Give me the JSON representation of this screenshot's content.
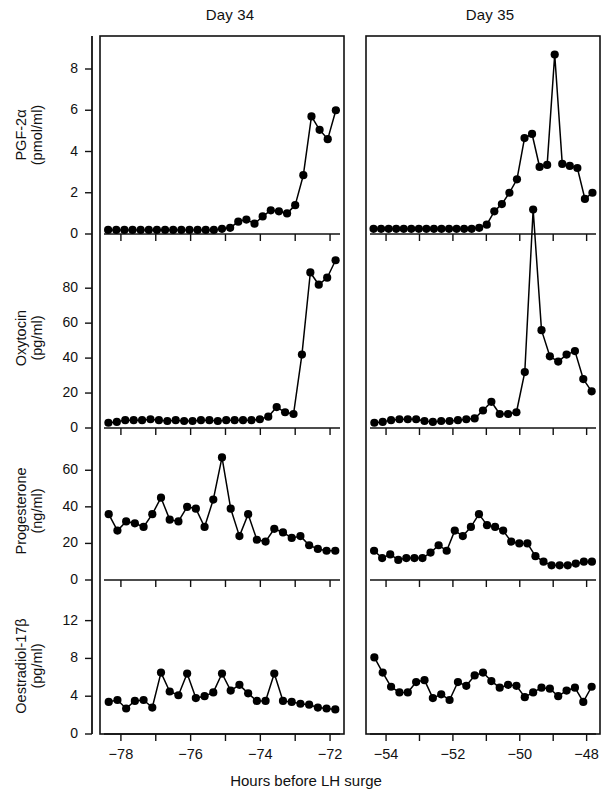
{
  "figure": {
    "xaxis_title": "Hours before LH surge",
    "panel_titles": [
      "Day 34",
      "Day 35"
    ]
  },
  "chart_data": {
    "type": "line",
    "xlabel": "Hours before LH surge",
    "grid": false,
    "legend": "none",
    "columns": [
      {
        "name": "Day 34",
        "xlim": [
          -78.6,
          -71.6
        ],
        "xticks": [
          -78,
          -77,
          -76,
          -75,
          -74,
          -73,
          -72
        ],
        "xticklabels": [
          "−78",
          "",
          "−76",
          "",
          "−74",
          "",
          "−72"
        ]
      },
      {
        "name": "Day 35",
        "xlim": [
          -54.6,
          -47.6
        ],
        "xticks": [
          -54,
          -53,
          -52,
          -51,
          -50,
          -49,
          -48
        ],
        "xticklabels": [
          "−54",
          "",
          "−52",
          "",
          "−50",
          "",
          "−48"
        ]
      }
    ],
    "rows": [
      {
        "id": "pgf2a",
        "ylabel_line1": "PGF-2α",
        "ylabel_line2": "(pmol/ml)",
        "units": "pmol/ml",
        "ylim": [
          0,
          9.6
        ],
        "yticks": [
          0,
          2,
          4,
          6,
          8
        ],
        "yticklabels": [
          "0",
          "2",
          "4",
          "6",
          "8"
        ],
        "series": [
          {
            "name": "Day 34",
            "column": 0,
            "x": [
              -78.45,
              -78.2,
              -77.95,
              -77.7,
              -77.45,
              -77.2,
              -76.95,
              -76.7,
              -76.45,
              -76.2,
              -75.95,
              -75.7,
              -75.45,
              -75.2,
              -74.95,
              -74.7,
              -74.45,
              -74.2,
              -73.95,
              -73.7,
              -73.45,
              -73.2,
              -72.95,
              -72.7,
              -72.45,
              -72.2,
              -71.95,
              -71.7
            ],
            "values": [
              0.2,
              0.2,
              0.2,
              0.2,
              0.2,
              0.2,
              0.2,
              0.2,
              0.2,
              0.2,
              0.2,
              0.2,
              0.2,
              0.2,
              0.25,
              0.3,
              0.6,
              0.7,
              0.5,
              0.85,
              1.15,
              1.1,
              1.0,
              1.4,
              2.85,
              5.7,
              5.05,
              4.6,
              6.0
            ]
          },
          {
            "name": "Day 35",
            "column": 1,
            "x": [
              -54.45,
              -54.2,
              -53.95,
              -53.7,
              -53.45,
              -53.2,
              -52.95,
              -52.7,
              -52.45,
              -52.2,
              -51.95,
              -51.7,
              -51.45,
              -51.2,
              -50.95,
              -50.7,
              -50.45,
              -50.2,
              -49.95,
              -49.7,
              -49.45,
              -49.2,
              -48.95,
              -48.7,
              -48.45,
              -48.2,
              -47.95,
              -47.7
            ],
            "values": [
              0.25,
              0.25,
              0.25,
              0.25,
              0.25,
              0.25,
              0.25,
              0.25,
              0.25,
              0.25,
              0.25,
              0.25,
              0.25,
              0.25,
              0.3,
              0.45,
              1.1,
              1.45,
              2.0,
              2.65,
              4.65,
              4.85,
              3.25,
              3.35,
              8.7,
              3.4,
              3.3,
              3.2,
              1.7,
              2.0
            ]
          }
        ]
      },
      {
        "id": "oxytocin",
        "ylabel_line1": "Oxytocin",
        "ylabel_line2": "(pg/ml)",
        "units": "pg/ml",
        "ylim": [
          0,
          103
        ],
        "yticks": [
          0,
          20,
          40,
          60,
          80
        ],
        "yticklabels": [
          "0",
          "20",
          "40",
          "60",
          "80"
        ],
        "series": [
          {
            "name": "Day 34",
            "column": 0,
            "x": [
              -78.45,
              -78.2,
              -77.95,
              -77.7,
              -77.45,
              -77.2,
              -76.95,
              -76.7,
              -76.45,
              -76.2,
              -75.95,
              -75.7,
              -75.45,
              -75.2,
              -74.95,
              -74.7,
              -74.45,
              -74.2,
              -73.95,
              -73.7,
              -73.45,
              -73.2,
              -72.95,
              -72.7,
              -72.45,
              -72.2,
              -71.95,
              -71.7
            ],
            "values": [
              3.0,
              3.5,
              4.5,
              4.5,
              4.5,
              5.0,
              4.5,
              4.0,
              4.5,
              4.0,
              4.0,
              4.5,
              4.5,
              4.0,
              4.5,
              4.5,
              4.5,
              4.5,
              5.0,
              6.5,
              12.0,
              9.0,
              8.0,
              42.0,
              89.0,
              82.0,
              86.0,
              96.0
            ]
          },
          {
            "name": "Day 35",
            "column": 1,
            "x": [
              -54.45,
              -54.2,
              -53.95,
              -53.7,
              -53.45,
              -53.2,
              -52.95,
              -52.7,
              -52.45,
              -52.2,
              -51.95,
              -51.7,
              -51.45,
              -51.2,
              -50.95,
              -50.7,
              -50.45,
              -50.2,
              -49.95,
              -49.7,
              -49.45,
              -49.2,
              -48.95,
              -48.7,
              -48.45,
              -48.2,
              -47.95,
              -47.7
            ],
            "values": [
              3.0,
              3.5,
              4.5,
              5.0,
              5.0,
              5.0,
              4.0,
              3.5,
              4.0,
              4.0,
              4.5,
              5.0,
              5.5,
              10.0,
              15.0,
              8.0,
              8.0,
              9.0,
              32.0,
              125.0,
              56.0,
              41.0,
              38.0,
              42.0,
              44.0,
              28.0,
              21.0
            ]
          }
        ]
      },
      {
        "id": "progesterone",
        "ylabel_line1": "Progesterone",
        "ylabel_line2": "(ng/ml)",
        "units": "ng/ml",
        "ylim": [
          0,
          76
        ],
        "yticks": [
          0,
          20,
          40,
          60
        ],
        "yticklabels": [
          "0",
          "20",
          "40",
          "60"
        ],
        "series": [
          {
            "name": "Day 34",
            "column": 0,
            "x": [
              -78.45,
              -78.2,
              -77.95,
              -77.7,
              -77.45,
              -77.2,
              -76.95,
              -76.7,
              -76.45,
              -76.2,
              -75.95,
              -75.7,
              -75.45,
              -75.2,
              -74.95,
              -74.7,
              -74.45,
              -74.2,
              -73.95,
              -73.7,
              -73.45,
              -73.2,
              -72.95,
              -72.7,
              -72.45,
              -72.2,
              -71.95,
              -71.7
            ],
            "values": [
              36.0,
              27.0,
              32.0,
              31.0,
              29.0,
              36.0,
              45.0,
              33.0,
              32.0,
              40.0,
              39.0,
              29.0,
              44.0,
              67.0,
              39.0,
              24.0,
              36.0,
              22.0,
              21.0,
              28.0,
              26.0,
              23.0,
              24.0,
              19.0,
              17.0,
              16.0,
              16.0
            ]
          },
          {
            "name": "Day 35",
            "column": 1,
            "x": [
              -54.45,
              -54.2,
              -53.95,
              -53.7,
              -53.45,
              -53.2,
              -52.95,
              -52.7,
              -52.45,
              -52.2,
              -51.95,
              -51.7,
              -51.45,
              -51.2,
              -50.95,
              -50.7,
              -50.45,
              -50.2,
              -49.95,
              -49.7,
              -49.45,
              -49.2,
              -48.95,
              -48.7,
              -48.45,
              -48.2,
              -47.95,
              -47.7
            ],
            "values": [
              16.0,
              12.0,
              14.0,
              11.0,
              12.0,
              12.0,
              12.0,
              15.0,
              19.0,
              16.0,
              27.0,
              24.0,
              29.0,
              36.0,
              30.0,
              29.0,
              27.0,
              21.0,
              20.0,
              20.0,
              13.0,
              10.0,
              8.0,
              8.0,
              8.0,
              9.0,
              10.0,
              10.0
            ]
          }
        ]
      },
      {
        "id": "oestradiol",
        "ylabel_line1": "Oestradiol-17β",
        "ylabel_line2": "(pg/ml)",
        "units": "pg/ml",
        "ylim": [
          0,
          14.5
        ],
        "yticks": [
          0,
          4,
          8,
          12
        ],
        "yticklabels": [
          "0",
          "4",
          "8",
          "12"
        ],
        "series": [
          {
            "name": "Day 34",
            "column": 0,
            "x": [
              -78.45,
              -78.2,
              -77.95,
              -77.7,
              -77.45,
              -77.2,
              -76.95,
              -76.7,
              -76.45,
              -76.2,
              -75.95,
              -75.7,
              -75.45,
              -75.2,
              -74.95,
              -74.7,
              -74.45,
              -74.2,
              -73.95,
              -73.7,
              -73.45,
              -73.2,
              -72.95,
              -72.7,
              -72.45,
              -72.2,
              -71.95,
              -71.7
            ],
            "values": [
              3.4,
              3.6,
              2.7,
              3.5,
              3.6,
              2.8,
              6.5,
              4.5,
              4.1,
              6.4,
              3.8,
              4.0,
              4.4,
              6.4,
              4.6,
              5.2,
              4.3,
              3.5,
              3.5,
              6.4,
              3.5,
              3.4,
              3.2,
              3.1,
              2.8,
              2.7,
              2.6
            ]
          },
          {
            "name": "Day 35",
            "column": 1,
            "x": [
              -54.45,
              -54.2,
              -53.95,
              -53.7,
              -53.45,
              -53.2,
              -52.95,
              -52.7,
              -52.45,
              -52.2,
              -51.95,
              -51.7,
              -51.45,
              -51.2,
              -50.95,
              -50.7,
              -50.45,
              -50.2,
              -49.95,
              -49.7,
              -49.45,
              -49.2,
              -48.95,
              -48.7,
              -48.45,
              -48.2,
              -47.95,
              -47.7
            ],
            "values": [
              8.1,
              6.5,
              5.0,
              4.4,
              4.4,
              5.5,
              5.7,
              3.8,
              4.2,
              3.6,
              5.5,
              5.1,
              6.2,
              6.5,
              5.6,
              4.9,
              5.2,
              5.1,
              3.9,
              4.4,
              4.9,
              4.8,
              4.0,
              4.6,
              4.9,
              3.4,
              5.0
            ]
          }
        ]
      }
    ]
  }
}
